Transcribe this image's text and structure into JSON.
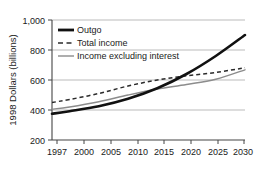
{
  "chart_data": {
    "type": "line",
    "title": "",
    "xlabel": "",
    "ylabel": "1998 Dollars (billions)",
    "xlim": [
      1997,
      2030
    ],
    "ylim": [
      200,
      1000
    ],
    "yticks": [
      "200",
      "400",
      "600",
      "800",
      "1,000"
    ],
    "ytick_values": [
      200,
      400,
      600,
      800,
      1000
    ],
    "xticks": [
      "1997",
      "2000",
      "2005",
      "2010",
      "2015",
      "2020",
      "2025",
      "2030"
    ],
    "xtick_values": [
      1997,
      2000,
      2005,
      2010,
      2015,
      2020,
      2025,
      2030
    ],
    "grid": "horizontal",
    "legend_position": "top-left",
    "x": [
      1997,
      2000,
      2005,
      2010,
      2015,
      2020,
      2025,
      2030
    ],
    "series": [
      {
        "name": "Outgo",
        "style": "thick-solid",
        "color": "#111111",
        "values": [
          375,
          392,
          425,
          475,
          545,
          640,
          760,
          900
        ]
      },
      {
        "name": "Total income",
        "style": "dashed",
        "color": "#2b2b2b",
        "values": [
          450,
          470,
          510,
          560,
          600,
          628,
          650,
          682
        ]
      },
      {
        "name": "Income excluding interest",
        "style": "thin-solid",
        "color": "#8c8c8c",
        "values": [
          405,
          420,
          455,
          500,
          540,
          570,
          605,
          668
        ]
      }
    ]
  },
  "legend": {
    "items": [
      {
        "label": "Outgo",
        "swatch": "thick-solid-line-swatch"
      },
      {
        "label": "Total income",
        "swatch": "dashed-line-swatch"
      },
      {
        "label": "Income excluding interest",
        "swatch": "thin-solid-line-swatch"
      }
    ]
  },
  "axes": {
    "y_title": "1998 Dollars (billions)",
    "y_labels": [
      "1,000",
      "800",
      "600",
      "400",
      "200"
    ],
    "x_labels": [
      "1997",
      "2000",
      "2005",
      "2010",
      "2015",
      "2020",
      "2025",
      "2030"
    ]
  },
  "colors": {
    "outgo": "#111111",
    "total_income": "#2b2b2b",
    "income_excluding_interest": "#8c8c8c",
    "grid": "#a9a9a9",
    "axis": "#555555",
    "text": "#1a1a1a",
    "background": "#ffffff"
  }
}
